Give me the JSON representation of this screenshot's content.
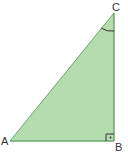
{
  "diagram": {
    "type": "right-triangle",
    "fill_color": "#b5dcae",
    "edge_color": "#6aa86a",
    "vertices": [
      {
        "name": "A",
        "label": "A",
        "x": 10,
        "y": 141
      },
      {
        "name": "B",
        "label": "B",
        "x": 114,
        "y": 141
      },
      {
        "name": "C",
        "label": "C",
        "x": 114,
        "y": 13
      }
    ],
    "right_angle_at": "B",
    "angle_marked_at": "C"
  }
}
